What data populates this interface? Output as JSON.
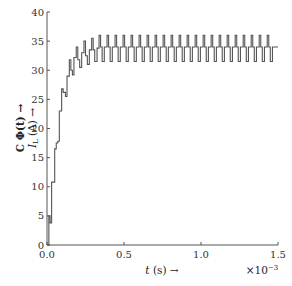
{
  "chart_data": {
    "type": "line",
    "title": "",
    "xlabel": "t (s) →",
    "x_multiplier": "×10",
    "x_multiplier_exp": "−3",
    "ylabel_line1": "C Φ(t) →",
    "ylabel_line2_main": "I",
    "ylabel_line2_sub": "L",
    "ylabel_line2_rest": " (A) →",
    "xlim": [
      0,
      1.5
    ],
    "ylim": [
      0,
      40
    ],
    "xticks": [
      0.0,
      0.5,
      1.0,
      1.5
    ],
    "xtick_labels": [
      "0.0",
      "0.5",
      "1.0",
      "1.5"
    ],
    "yticks": [
      0,
      5,
      10,
      15,
      20,
      25,
      30,
      35,
      40
    ],
    "ytick_labels": [
      "0",
      "5",
      "10",
      "15",
      "20",
      "25",
      "30",
      "35",
      "40"
    ],
    "grid": false,
    "line_color": "#555555",
    "series": [
      {
        "name": "I_L",
        "step": true,
        "points": [
          [
            0.0,
            0
          ],
          [
            0.012,
            5.0
          ],
          [
            0.02,
            3.8
          ],
          [
            0.03,
            10.8
          ],
          [
            0.045,
            10.8
          ],
          [
            0.05,
            16.5
          ],
          [
            0.06,
            17.5
          ],
          [
            0.07,
            17.8
          ],
          [
            0.08,
            23.0
          ],
          [
            0.095,
            26.8
          ],
          [
            0.105,
            26.2
          ],
          [
            0.12,
            25.5
          ],
          [
            0.13,
            29.0
          ],
          [
            0.145,
            31.8
          ],
          [
            0.155,
            30.0
          ],
          [
            0.165,
            29.2
          ],
          [
            0.175,
            32.2
          ],
          [
            0.19,
            34.0
          ],
          [
            0.2,
            31.8
          ],
          [
            0.212,
            30.5
          ],
          [
            0.225,
            33.0
          ],
          [
            0.24,
            35.0
          ],
          [
            0.25,
            32.5
          ],
          [
            0.262,
            31.0
          ],
          [
            0.275,
            33.5
          ],
          [
            0.29,
            35.5
          ],
          [
            0.3,
            33.5
          ],
          [
            0.31,
            31.5
          ],
          [
            0.325,
            33.8
          ],
          [
            0.338,
            36.0
          ],
          [
            0.348,
            34.0
          ],
          [
            0.358,
            31.5
          ],
          [
            0.372,
            34.0
          ],
          [
            0.39,
            36.0
          ],
          [
            0.4,
            34.0
          ],
          [
            0.41,
            31.5
          ],
          [
            0.424,
            34.0
          ],
          [
            0.442,
            36.0
          ],
          [
            0.452,
            34.0
          ],
          [
            0.462,
            31.5
          ],
          [
            0.476,
            34.0
          ],
          [
            0.494,
            36.0
          ],
          [
            0.504,
            34.0
          ],
          [
            0.514,
            31.5
          ],
          [
            0.528,
            34.0
          ],
          [
            0.546,
            36.0
          ],
          [
            0.556,
            34.0
          ],
          [
            0.566,
            31.5
          ],
          [
            0.58,
            34.0
          ],
          [
            0.598,
            36.0
          ],
          [
            0.608,
            34.0
          ],
          [
            0.618,
            31.5
          ],
          [
            0.632,
            34.0
          ],
          [
            0.65,
            36.0
          ],
          [
            0.66,
            34.0
          ],
          [
            0.67,
            31.5
          ],
          [
            0.684,
            34.0
          ],
          [
            0.702,
            36.0
          ],
          [
            0.712,
            34.0
          ],
          [
            0.722,
            31.5
          ],
          [
            0.736,
            34.0
          ],
          [
            0.754,
            36.0
          ],
          [
            0.764,
            34.0
          ],
          [
            0.774,
            31.5
          ],
          [
            0.788,
            34.0
          ],
          [
            0.806,
            36.0
          ],
          [
            0.816,
            34.0
          ],
          [
            0.826,
            31.5
          ],
          [
            0.84,
            34.0
          ],
          [
            0.858,
            36.0
          ],
          [
            0.868,
            34.0
          ],
          [
            0.878,
            31.5
          ],
          [
            0.892,
            34.0
          ],
          [
            0.91,
            36.0
          ],
          [
            0.92,
            34.0
          ],
          [
            0.93,
            31.5
          ],
          [
            0.944,
            34.0
          ],
          [
            0.962,
            36.0
          ],
          [
            0.972,
            34.0
          ],
          [
            0.982,
            31.5
          ],
          [
            0.996,
            34.0
          ],
          [
            1.014,
            36.0
          ],
          [
            1.024,
            34.0
          ],
          [
            1.034,
            31.5
          ],
          [
            1.048,
            34.0
          ],
          [
            1.066,
            36.0
          ],
          [
            1.076,
            34.0
          ],
          [
            1.086,
            31.5
          ],
          [
            1.1,
            34.0
          ],
          [
            1.118,
            36.0
          ],
          [
            1.128,
            34.0
          ],
          [
            1.138,
            31.5
          ],
          [
            1.152,
            34.0
          ],
          [
            1.17,
            36.0
          ],
          [
            1.18,
            34.0
          ],
          [
            1.19,
            31.5
          ],
          [
            1.204,
            34.0
          ],
          [
            1.222,
            36.0
          ],
          [
            1.232,
            34.0
          ],
          [
            1.242,
            31.5
          ],
          [
            1.256,
            34.0
          ],
          [
            1.274,
            36.0
          ],
          [
            1.284,
            34.0
          ],
          [
            1.294,
            31.5
          ],
          [
            1.308,
            34.0
          ],
          [
            1.326,
            36.0
          ],
          [
            1.336,
            34.0
          ],
          [
            1.346,
            31.5
          ],
          [
            1.36,
            34.0
          ],
          [
            1.378,
            36.0
          ],
          [
            1.388,
            34.0
          ],
          [
            1.398,
            31.5
          ],
          [
            1.412,
            34.0
          ],
          [
            1.43,
            36.0
          ],
          [
            1.44,
            34.0
          ],
          [
            1.45,
            31.5
          ],
          [
            1.464,
            34.0
          ],
          [
            1.5,
            34.0
          ]
        ]
      }
    ]
  }
}
